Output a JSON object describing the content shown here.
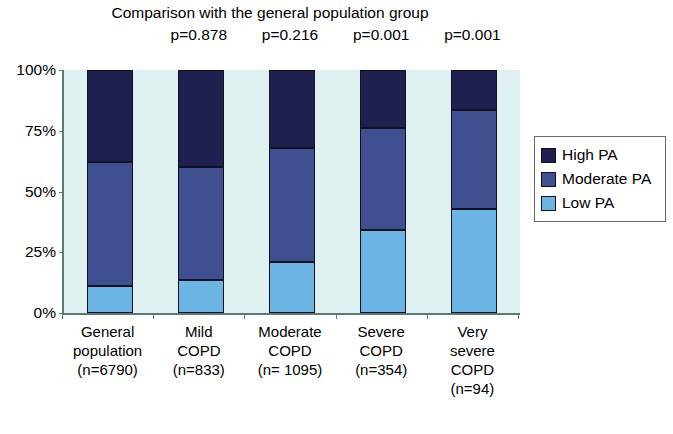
{
  "chart_data": {
    "type": "bar",
    "subtype": "stacked-bar-100-percent",
    "title": "Comparison with the general population group",
    "xlabel": "",
    "ylabel": "",
    "ylim": [
      0,
      100
    ],
    "ytick_labels": [
      "0%",
      "25%",
      "50%",
      "75%",
      "100%"
    ],
    "ytick_values": [
      0,
      25,
      50,
      75,
      100
    ],
    "grid": false,
    "legend_position": "right",
    "categories": [
      "General population (n=6790)",
      "Mild COPD (n=833)",
      "Moderate COPD (n= 1095)",
      "Severe COPD (n=354)",
      "Very severe COPD (n=94)"
    ],
    "category_lines": [
      [
        "General",
        "population",
        "(n=6790)"
      ],
      [
        "Mild",
        "COPD",
        "(n=833)"
      ],
      [
        "Moderate",
        "COPD",
        "(n= 1095)"
      ],
      [
        "Severe",
        "COPD",
        "(n=354)"
      ],
      [
        "Very",
        "severe",
        "COPD",
        "(n=94)"
      ]
    ],
    "series": [
      {
        "name": "Low PA",
        "color": "#6cb4e4",
        "values": [
          11,
          13.5,
          21,
          34,
          43
        ]
      },
      {
        "name": "Moderate PA",
        "color": "#3f4f8f",
        "values": [
          51,
          46.5,
          47,
          42,
          40.5
        ]
      },
      {
        "name": "High PA",
        "color": "#1f1f50",
        "values": [
          38,
          40,
          32,
          24,
          16.5
        ]
      }
    ],
    "annotations": [
      {
        "text": "p=0.878",
        "category_index": 1
      },
      {
        "text": "p=0.216",
        "category_index": 2
      },
      {
        "text": "p=0.001",
        "category_index": 3
      },
      {
        "text": "p=0.001",
        "category_index": 4
      }
    ]
  },
  "legend": {
    "items": [
      {
        "label": "High PA",
        "color": "#1f1f50"
      },
      {
        "label": "Moderate PA",
        "color": "#3f4f8f"
      },
      {
        "label": "Low PA",
        "color": "#6cb4e4"
      }
    ]
  },
  "colors": {
    "high_pa": "#1f1f50",
    "moderate_pa": "#3f4f8f",
    "low_pa": "#6cb4e4",
    "plot_background": "#dff0f0",
    "axis": "#5a7a7a",
    "page_background": "#ffffff"
  }
}
